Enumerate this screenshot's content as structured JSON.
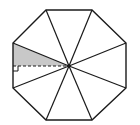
{
  "diagram": {
    "type": "regular-octagon-with-apothem",
    "colors": {
      "stroke": "#1a1a1a",
      "shade": "#c8c8c8",
      "background": "#ffffff"
    },
    "octagon_vertices": [
      [
        46,
        10
      ],
      [
        92,
        10
      ],
      [
        126,
        43
      ],
      [
        126,
        88
      ],
      [
        92,
        120
      ],
      [
        46,
        120
      ],
      [
        13,
        88
      ],
      [
        13,
        43
      ]
    ],
    "center": [
      69,
      66
    ],
    "shaded_triangle": [
      [
        13,
        43
      ],
      [
        13,
        66
      ],
      [
        69,
        66
      ]
    ],
    "apothem": {
      "from": [
        13,
        66
      ],
      "to": [
        69,
        66
      ],
      "style": "dashed"
    },
    "right_angle_marker": {
      "corner": [
        13,
        66
      ],
      "size": 5
    }
  }
}
